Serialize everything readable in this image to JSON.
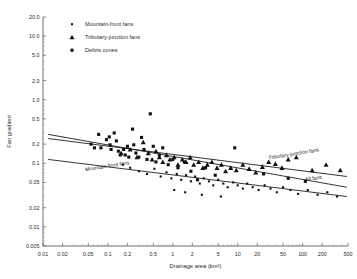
{
  "chart_data": {
    "type": "scatter",
    "title": "",
    "xlabel": "Drainage area (km²)",
    "ylabel": "Fan gradient",
    "xscale": "log",
    "yscale": "log",
    "xlim": [
      0.01,
      500
    ],
    "ylim": [
      0.005,
      20.0
    ],
    "grid": false,
    "legend_position": "top-left",
    "xticks": [
      "0.01",
      "0.02",
      "0.05",
      "0.1",
      "0.2",
      "0.5",
      "1",
      "2",
      "5",
      "10",
      "20",
      "50",
      "100",
      "200",
      "500"
    ],
    "xtick_values": [
      0.01,
      0.02,
      0.05,
      0.1,
      0.2,
      0.5,
      1,
      2,
      5,
      10,
      20,
      50,
      100,
      200,
      500
    ],
    "yticks": [
      "20.0",
      "10.0",
      "5.0",
      "2.0",
      "1.0",
      "0.5",
      "0.2",
      "0.1",
      "0.05",
      "0.02",
      "0.01",
      "0.005"
    ],
    "ytick_values": [
      20.0,
      10.0,
      5.0,
      2.0,
      1.0,
      0.5,
      0.2,
      0.1,
      0.05,
      0.02,
      0.01,
      0.005
    ],
    "legend": [
      {
        "label": "Mountain-front fans",
        "marker": "small-square"
      },
      {
        "label": "Tributary-junction fans",
        "marker": "triangle"
      },
      {
        "label": "Debris cones",
        "marker": "square"
      }
    ],
    "annotations": [
      {
        "text": "Mountain-front fans",
        "x": 0.045,
        "y": 0.075,
        "rotation": -9
      },
      {
        "text": "Tributary-junction fans",
        "x": 30,
        "y": 0.115,
        "rotation": -9
      },
      {
        "text": "All fans",
        "x": 110,
        "y": 0.052,
        "rotation": -9
      }
    ],
    "series": [
      {
        "name": "Debris cones",
        "marker": "square",
        "points": [
          [
            0.055,
            0.2
          ],
          [
            0.062,
            0.175
          ],
          [
            0.072,
            0.285
          ],
          [
            0.078,
            0.175
          ],
          [
            0.095,
            0.235
          ],
          [
            0.105,
            0.26
          ],
          [
            0.108,
            0.195
          ],
          [
            0.112,
            0.165
          ],
          [
            0.125,
            0.3
          ],
          [
            0.135,
            0.225
          ],
          [
            0.145,
            0.155
          ],
          [
            0.155,
            0.135
          ],
          [
            0.175,
            0.165
          ],
          [
            0.185,
            0.135
          ],
          [
            0.2,
            0.185
          ],
          [
            0.21,
            0.125
          ],
          [
            0.24,
            0.345
          ],
          [
            0.25,
            0.195
          ],
          [
            0.27,
            0.145
          ],
          [
            0.3,
            0.125
          ],
          [
            0.33,
            0.255
          ],
          [
            0.36,
            0.165
          ],
          [
            0.4,
            0.115
          ],
          [
            0.45,
            0.6
          ],
          [
            0.5,
            0.185
          ],
          [
            0.55,
            0.105
          ],
          [
            0.62,
            0.135
          ],
          [
            0.7,
            0.175
          ],
          [
            0.85,
            0.095
          ],
          [
            1.0,
            0.115
          ],
          [
            1.2,
            0.085
          ],
          [
            1.5,
            0.105
          ],
          [
            1.9,
            0.075
          ],
          [
            2.4,
            0.055
          ],
          [
            3.2,
            0.085
          ],
          [
            4.5,
            0.065
          ],
          [
            9.0,
            0.175
          ],
          [
            25,
            0.068
          ],
          [
            60,
            0.058
          ],
          [
            110,
            0.052
          ]
        ]
      },
      {
        "name": "Tributary-junction fans",
        "marker": "triangle",
        "points": [
          [
            0.16,
            0.145
          ],
          [
            0.22,
            0.165
          ],
          [
            0.28,
            0.125
          ],
          [
            0.35,
            0.215
          ],
          [
            0.42,
            0.145
          ],
          [
            0.48,
            0.115
          ],
          [
            0.55,
            0.155
          ],
          [
            0.62,
            0.125
          ],
          [
            0.7,
            0.105
          ],
          [
            0.8,
            0.135
          ],
          [
            0.9,
            0.115
          ],
          [
            1.05,
            0.125
          ],
          [
            1.2,
            0.095
          ],
          [
            1.4,
            0.115
          ],
          [
            1.6,
            0.105
          ],
          [
            1.85,
            0.125
          ],
          [
            2.1,
            0.095
          ],
          [
            2.5,
            0.105
          ],
          [
            2.9,
            0.085
          ],
          [
            3.4,
            0.095
          ],
          [
            4.0,
            0.105
          ],
          [
            4.8,
            0.085
          ],
          [
            5.6,
            0.095
          ],
          [
            6.5,
            0.075
          ],
          [
            7.8,
            0.085
          ],
          [
            9.5,
            0.078
          ],
          [
            12,
            0.095
          ],
          [
            15,
            0.082
          ],
          [
            19,
            0.072
          ],
          [
            24,
            0.088
          ],
          [
            30,
            0.105
          ],
          [
            38,
            0.098
          ],
          [
            48,
            0.085
          ],
          [
            60,
            0.115
          ],
          [
            80,
            0.125
          ],
          [
            140,
            0.078
          ],
          [
            230,
            0.095
          ],
          [
            380,
            0.078
          ]
        ]
      },
      {
        "name": "Mountain-front fans",
        "marker": "small-square",
        "points": [
          [
            0.3,
            0.075
          ],
          [
            0.4,
            0.068
          ],
          [
            0.52,
            0.082
          ],
          [
            0.65,
            0.062
          ],
          [
            0.8,
            0.072
          ],
          [
            0.95,
            0.058
          ],
          [
            1.15,
            0.068
          ],
          [
            1.35,
            0.055
          ],
          [
            1.6,
            0.065
          ],
          [
            1.9,
            0.052
          ],
          [
            2.2,
            0.062
          ],
          [
            2.6,
            0.048
          ],
          [
            3.0,
            0.058
          ],
          [
            3.6,
            0.052
          ],
          [
            4.2,
            0.045
          ],
          [
            5.0,
            0.055
          ],
          [
            6.0,
            0.048
          ],
          [
            7.0,
            0.042
          ],
          [
            8.5,
            0.05
          ],
          [
            10,
            0.045
          ],
          [
            12,
            0.04
          ],
          [
            14,
            0.048
          ],
          [
            17,
            0.042
          ],
          [
            21,
            0.038
          ],
          [
            26,
            0.045
          ],
          [
            32,
            0.04
          ],
          [
            40,
            0.035
          ],
          [
            50,
            0.042
          ],
          [
            65,
            0.038
          ],
          [
            85,
            0.033
          ],
          [
            120,
            0.038
          ],
          [
            170,
            0.032
          ],
          [
            240,
            0.035
          ],
          [
            340,
            0.03
          ],
          [
            0.22,
            0.085
          ],
          [
            0.17,
            0.095
          ],
          [
            1.05,
            0.038
          ],
          [
            1.55,
            0.035
          ],
          [
            2.8,
            0.032
          ],
          [
            5.5,
            0.03
          ]
        ]
      }
    ],
    "fit_lines": [
      {
        "name": "Mountain-front fans",
        "x1": 0.012,
        "y1": 0.115,
        "x2": 480,
        "y2": 0.03
      },
      {
        "name": "Tributary-junction fans",
        "x1": 0.012,
        "y1": 0.245,
        "x2": 480,
        "y2": 0.062
      },
      {
        "name": "All fans",
        "x1": 0.012,
        "y1": 0.285,
        "x2": 480,
        "y2": 0.042
      }
    ]
  }
}
